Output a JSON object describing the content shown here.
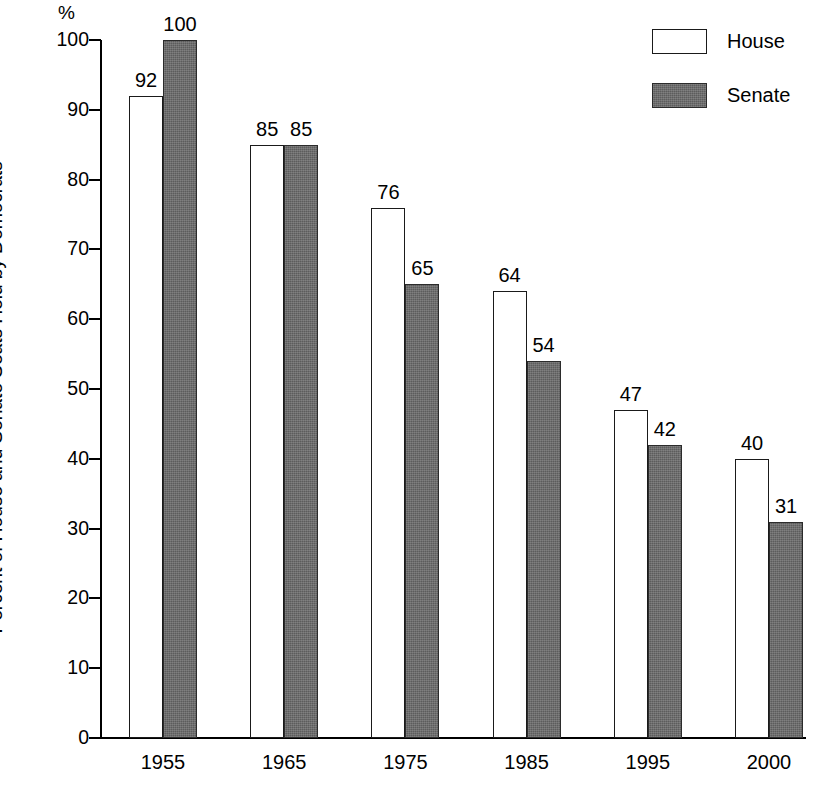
{
  "chart_data": {
    "type": "bar",
    "title": "",
    "subtitle": "",
    "xlabel": "",
    "ylabel": "Percent of House and Senate Seats Held by Democrats",
    "unit_label": "%",
    "categories": [
      "1955",
      "1965",
      "1975",
      "1985",
      "1995",
      "2000"
    ],
    "series": [
      {
        "name": "House",
        "values": [
          92,
          85,
          76,
          64,
          47,
          40
        ],
        "color": "#ffffff",
        "swatch": "house-swatch"
      },
      {
        "name": "Senate",
        "values": [
          100,
          85,
          65,
          54,
          42,
          31
        ],
        "color": "#5c5c5c",
        "swatch": "senate-swatch"
      }
    ],
    "ylim": [
      0,
      100
    ],
    "yticks": [
      0,
      10,
      20,
      30,
      40,
      50,
      60,
      70,
      80,
      90,
      100
    ],
    "ytick_labels": [
      "0",
      "10",
      "20",
      "30",
      "40",
      "50",
      "60",
      "70",
      "80",
      "90",
      "100"
    ],
    "grid": false,
    "legend_position": "top-right",
    "data_labels": true
  },
  "legend": {
    "items": [
      {
        "label": "House"
      },
      {
        "label": "Senate"
      }
    ]
  }
}
